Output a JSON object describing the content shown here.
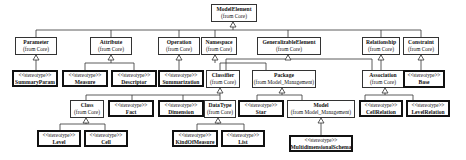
{
  "diagram": {
    "type": "UML class hierarchy",
    "root": {
      "name": "ModelElement",
      "from": "(from Core)"
    },
    "level1": [
      {
        "name": "Parameter",
        "from": "(from Core)"
      },
      {
        "name": "Attribute",
        "from": "(from Core)"
      },
      {
        "name": "Operation",
        "from": "(from Core)"
      },
      {
        "name": "Namespace",
        "from": "(from Core)"
      },
      {
        "name": "GeneralizableElement",
        "from": "(from Core)"
      },
      {
        "name": "Relationship",
        "from": "(from Core)"
      },
      {
        "name": "Constraint",
        "from": "(from Core)"
      }
    ],
    "level2": {
      "summaryParam": {
        "stereotype": "<<stereotype>>",
        "name": "SummaryParam"
      },
      "measure": {
        "stereotype": "<<stereotype>>",
        "name": "Measure"
      },
      "descriptor": {
        "stereotype": "<<stereotype>>",
        "name": "Descriptor"
      },
      "summarization": {
        "stereotype": "<<stereotype>>",
        "name": "Summarization"
      },
      "classifier": {
        "name": "Classifier",
        "from": "(from Core)"
      },
      "package": {
        "name": "Package",
        "from": "(from Model_Management)"
      },
      "association": {
        "name": "Association",
        "from": "(from Core)"
      },
      "base": {
        "stereotype": "<<stereotype>>",
        "name": "Base"
      }
    },
    "level3": {
      "class": {
        "name": "Class",
        "from": "(from Core)"
      },
      "fact": {
        "stereotype": "<<stereotype>>",
        "name": "Fact"
      },
      "dimension": {
        "stereotype": "<<stereotype>>",
        "name": "Dimension"
      },
      "datatype": {
        "name": "DataType",
        "from": "(from Core)"
      },
      "star": {
        "stereotype": "<<stereotype>>",
        "name": "Star"
      },
      "model": {
        "name": "Model",
        "from": "(from Model_Management)"
      },
      "cellRelation": {
        "stereotype": "<<stereotype>>",
        "name": "CellRelation"
      },
      "levelRelation": {
        "stereotype": "<<stereotype>>",
        "name": "LevelRelation"
      }
    },
    "level4": {
      "level": {
        "stereotype": "<<stereotype>>",
        "name": "Level"
      },
      "cell": {
        "stereotype": "<<stereotype>>",
        "name": "Cell"
      },
      "kindOfMeasure": {
        "stereotype": "<<stereotype>>",
        "name": "KindOfMeasure"
      },
      "list": {
        "stereotype": "<<stereotype>>",
        "name": "List"
      },
      "multidimensionalSchema": {
        "stereotype": "<<stereotype>>",
        "name": "MultidimensionalSchema"
      }
    }
  }
}
